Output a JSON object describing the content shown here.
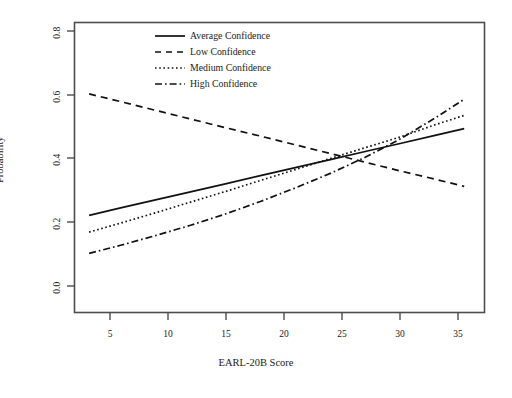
{
  "figure": {
    "background_color": "#ffffff",
    "foreground_color": "#1a1a1a",
    "frame_color": "#4d4d4d"
  },
  "axes": {
    "x_title": "EARL-20B Score",
    "y_title": "Probability",
    "x_ticks": [
      "5",
      "10",
      "15",
      "20",
      "25",
      "30",
      "35"
    ],
    "y_ticks": [
      "0.0",
      "0.2",
      "0.4",
      "0.6",
      "0.8"
    ]
  },
  "legend": {
    "entries": [
      {
        "label": "Average Confidence",
        "style": "solid"
      },
      {
        "label": "Low Confidence",
        "style": "dashed"
      },
      {
        "label": "Medium Confidence",
        "style": "dotted"
      },
      {
        "label": "High Confidence",
        "style": "dashdot"
      }
    ]
  },
  "chart_data": {
    "type": "line",
    "title": "",
    "subtitle": "",
    "xlabel": "EARL-20B Score",
    "ylabel": "Probability",
    "xlim": [
      2.0,
      37.2
    ],
    "ylim": [
      -0.04,
      0.86
    ],
    "xticks": [
      5,
      10,
      15,
      20,
      25,
      30,
      35
    ],
    "yticks": [
      0.0,
      0.2,
      0.4,
      0.6,
      0.8
    ],
    "grid": false,
    "legend_position": "top-center",
    "x": [
      3.3,
      6,
      9,
      12,
      15,
      18,
      21,
      24,
      27,
      30,
      33,
      35.5
    ],
    "series": [
      {
        "name": "Average Confidence",
        "style": "solid",
        "values": [
          0.26,
          0.283,
          0.308,
          0.333,
          0.358,
          0.383,
          0.408,
          0.433,
          0.458,
          0.483,
          0.508,
          0.529
        ]
      },
      {
        "name": "Low Confidence",
        "style": "dashed",
        "values": [
          0.637,
          0.613,
          0.586,
          0.559,
          0.532,
          0.506,
          0.479,
          0.452,
          0.425,
          0.398,
          0.372,
          0.35
        ]
      },
      {
        "name": "Medium Confidence",
        "style": "dotted",
        "values": [
          0.208,
          0.236,
          0.268,
          0.301,
          0.334,
          0.368,
          0.402,
          0.436,
          0.47,
          0.503,
          0.541,
          0.57
        ]
      },
      {
        "name": "High Confidence",
        "style": "dashdot",
        "values": [
          0.142,
          0.167,
          0.197,
          0.229,
          0.264,
          0.303,
          0.345,
          0.39,
          0.44,
          0.497,
          0.562,
          0.62
        ]
      }
    ]
  }
}
